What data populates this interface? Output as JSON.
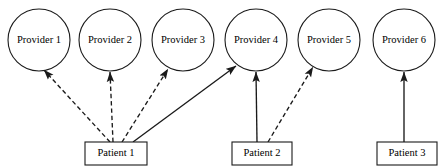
{
  "diagram": {
    "type": "bipartite-graph",
    "background_color": "#ffffff",
    "line_color": "#1a1a1a",
    "providers": [
      {
        "id": "provider-1",
        "label": "Provider 1",
        "cx": 39,
        "cy": 40,
        "r": 31
      },
      {
        "id": "provider-2",
        "label": "Provider 2",
        "cx": 110,
        "cy": 40,
        "r": 31
      },
      {
        "id": "provider-3",
        "label": "Provider 3",
        "cx": 183,
        "cy": 40,
        "r": 31
      },
      {
        "id": "provider-4",
        "label": "Provider 4",
        "cx": 256,
        "cy": 40,
        "r": 31
      },
      {
        "id": "provider-5",
        "label": "Provider 5",
        "cx": 329,
        "cy": 40,
        "r": 31
      },
      {
        "id": "provider-6",
        "label": "Provider 6",
        "cx": 404,
        "cy": 40,
        "r": 31
      }
    ],
    "patients": [
      {
        "id": "patient-1",
        "label": "Patient 1",
        "x": 85,
        "y": 142,
        "width": 62,
        "height": 23
      },
      {
        "id": "patient-2",
        "label": "Patient 2",
        "x": 232,
        "y": 142,
        "width": 60,
        "height": 23
      },
      {
        "id": "patient-3",
        "label": "Patient 3",
        "x": 377,
        "y": 142,
        "width": 60,
        "height": 23
      }
    ],
    "edges": [
      {
        "id": "edge-patient1-provider1",
        "from": "patient-1",
        "to": "provider-1",
        "style": "dashed",
        "x1": 110,
        "y1": 142,
        "x2": 44,
        "y2": 70
      },
      {
        "id": "edge-patient1-provider2",
        "from": "patient-1",
        "to": "provider-2",
        "style": "dashed",
        "x1": 113,
        "y1": 142,
        "x2": 110,
        "y2": 72
      },
      {
        "id": "edge-patient1-provider3",
        "from": "patient-1",
        "to": "provider-3",
        "style": "dashed",
        "x1": 122,
        "y1": 142,
        "x2": 168,
        "y2": 69
      },
      {
        "id": "edge-patient1-provider4",
        "from": "patient-1",
        "to": "provider-4",
        "style": "solid",
        "x1": 133,
        "y1": 142,
        "x2": 236,
        "y2": 66
      },
      {
        "id": "edge-patient2-provider4",
        "from": "patient-2",
        "to": "provider-4",
        "style": "solid",
        "x1": 257,
        "y1": 142,
        "x2": 256,
        "y2": 72
      },
      {
        "id": "edge-patient2-provider5",
        "from": "patient-2",
        "to": "provider-5",
        "style": "dashed",
        "x1": 268,
        "y1": 142,
        "x2": 313,
        "y2": 67
      },
      {
        "id": "edge-patient3-provider6",
        "from": "patient-3",
        "to": "provider-6",
        "style": "solid",
        "x1": 404,
        "y1": 142,
        "x2": 404,
        "y2": 72
      }
    ]
  }
}
